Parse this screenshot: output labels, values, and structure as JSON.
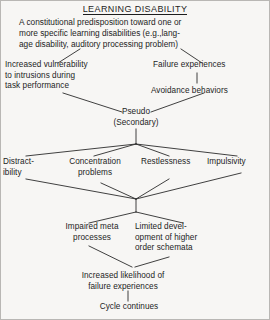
{
  "diagram": {
    "title": "LEARNING DISABILITY",
    "lead": "A constitutional predisposition toward one or\nmore specific learning disabilities (e.g.,lang-\nage disability, auditory processing problem)",
    "nodes": {
      "vulnerability": "Increased vulnerability\nto intrusions during\ntask performance",
      "failure_experiences": "Failure experiences",
      "avoidance": "Avoidance behaviors",
      "pseudo": "Pseudo\n(Secondary)",
      "distractibility": "Distract-\nibility",
      "concentration": "Concentration\nproblems",
      "restlessness": "Restlessness",
      "impulsivity": "Impulsivity",
      "impaired_meta": "Impaired meta\nprocesses",
      "limited_development": "Limited devel-\nopment of higher\norder schemata",
      "increased_likelihood": "Increased likelihood of\nfailure experiences",
      "cycle": "Cycle continues"
    },
    "colors": {
      "background": "#f7f6f4",
      "text": "#1d1d1d",
      "line": "#2b2b2b",
      "border": "#b9b7b4"
    }
  }
}
